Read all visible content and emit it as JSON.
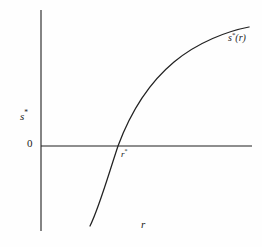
{
  "figure": {
    "background_color": "#fefefe",
    "ink_color": "#1f1f1f",
    "axes": {
      "y_axis_label": "s",
      "y_axis_label_superscript": "*",
      "x_axis_label": "r",
      "origin_tick_label": "0",
      "y_axis_x_px": 41,
      "y_axis_top_px": 10,
      "y_axis_bottom_px": 231,
      "x_axis_y_px": 146,
      "x_axis_left_px": 41,
      "x_axis_right_px": 252
    },
    "curve": {
      "label": "s",
      "label_superscript": "*",
      "label_argument": "(r)",
      "shape": "increasing-concave-down",
      "start_px": [
        90,
        226
      ],
      "end_px": [
        249,
        27
      ],
      "x_axis_crossing_px": [
        118,
        146
      ],
      "path": "M 90,226 C 99,208 108,176 118,146 C 131,111 150,82 174,62 C 198,42 228,31 249,27"
    },
    "root_marker": {
      "label": "r",
      "label_superscript": "*",
      "x_px": 118,
      "y_px": 146
    }
  },
  "chart_data": {
    "type": "line",
    "title": "",
    "xlabel": "r",
    "ylabel": "s*",
    "legend": [],
    "grid": false,
    "annotations": [
      {
        "text": "s*(r)",
        "role": "curve-label",
        "x_px": 228,
        "y_px": 33
      },
      {
        "text": "r*",
        "role": "x-intercept-label",
        "x_px": 121,
        "y_px": 150
      },
      {
        "text": "0",
        "role": "origin-tick",
        "x_px": 27,
        "y_px": 138
      }
    ],
    "series": [
      {
        "name": "s*(r)",
        "description": "Optimal s as an increasing concave function of r, crossing zero at r*",
        "x": [
          0.3,
          0.42,
          0.55,
          0.72,
          0.9,
          1.1,
          1.35,
          1.6,
          1.85,
          2.1
        ],
        "y": [
          -1.6,
          -1.05,
          -0.5,
          0.0,
          0.42,
          0.85,
          1.25,
          1.55,
          1.78,
          1.92
        ]
      }
    ],
    "xlim": [
      0,
      2.4
    ],
    "ylim": [
      -2.0,
      2.2
    ],
    "zero_crossing": {
      "x": 0.72,
      "y": 0.0,
      "label": "r*"
    }
  }
}
